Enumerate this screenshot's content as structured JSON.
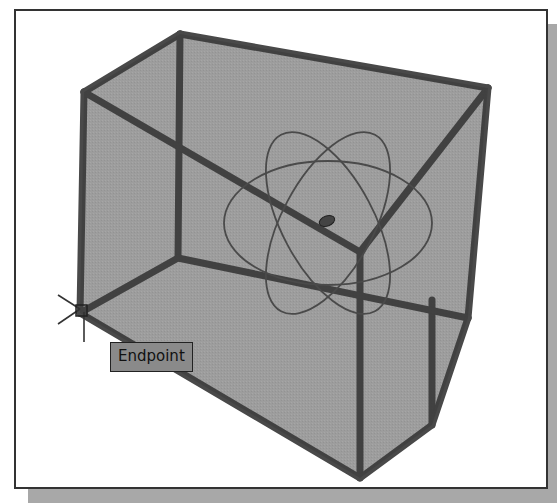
{
  "viewport": {
    "background": "#ffffff",
    "frame_border": "#333333",
    "shadow_color": "#a8a8a8"
  },
  "model": {
    "type": "wireframe-solid",
    "face_color": "#9a9a9a",
    "edge_color": "#3a3a3a"
  },
  "gizmo": {
    "type": "3d-orbit-rings",
    "ring_color": "#4a4a4a"
  },
  "osnap": {
    "tooltip": "Endpoint",
    "marker": "endpoint-square",
    "cursor": "crosshair"
  }
}
